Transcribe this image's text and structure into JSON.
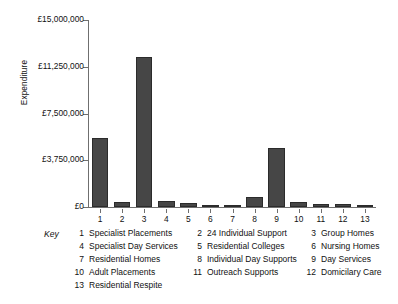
{
  "chart_data": {
    "type": "bar",
    "title": "",
    "xlabel": "",
    "ylabel": "Expenditure",
    "ylim": [
      0,
      15000000
    ],
    "grid": false,
    "legend_position": "below",
    "categories": [
      "1",
      "2",
      "3",
      "4",
      "5",
      "6",
      "7",
      "8",
      "9",
      "10",
      "11",
      "12",
      "13"
    ],
    "values": [
      5500000,
      400000,
      12050000,
      480000,
      320000,
      160000,
      160000,
      800000,
      4700000,
      400000,
      240000,
      240000,
      160000
    ],
    "ytick_labels": [
      "£15,000,000",
      "£11,250,000",
      "£7,500,000",
      "£3,750,000",
      "£0"
    ],
    "ytick_values": [
      15000000,
      11250000,
      7500000,
      3750000,
      0
    ],
    "bar_color": "#464646",
    "axis_color": "#6f6f6f"
  },
  "key": {
    "title": "Key",
    "items": [
      {
        "num": "1",
        "name": "Specialist Placements"
      },
      {
        "num": "2",
        "name": "24 Individual Support"
      },
      {
        "num": "3",
        "name": "Group Homes"
      },
      {
        "num": "4",
        "name": "Specialist Day Services"
      },
      {
        "num": "5",
        "name": "Residential Colleges"
      },
      {
        "num": "6",
        "name": "Nursing Homes"
      },
      {
        "num": "7",
        "name": "Residential Homes"
      },
      {
        "num": "8",
        "name": "Individual Day Supports"
      },
      {
        "num": "9",
        "name": "Day Services"
      },
      {
        "num": "10",
        "name": "Adult Placements"
      },
      {
        "num": "11",
        "name": "Outreach Supports"
      },
      {
        "num": "12",
        "name": "Domicilary Care"
      },
      {
        "num": "13",
        "name": "Residential Respite"
      }
    ]
  }
}
